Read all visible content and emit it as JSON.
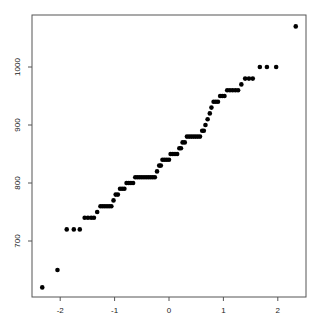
{
  "chart_data": {
    "type": "scatter",
    "title": "",
    "xlabel": "",
    "ylabel": "",
    "xlim": [
      -2.45,
      2.5
    ],
    "ylim": [
      595,
      1085
    ],
    "xticks": [
      -2,
      -1,
      0,
      1,
      2
    ],
    "yticks": [
      700,
      800,
      900,
      1000
    ],
    "grid": false,
    "legend": null,
    "point_color": "#000000",
    "points": [
      [
        -2.33,
        620
      ],
      [
        -2.05,
        650
      ],
      [
        -1.88,
        720
      ],
      [
        -1.75,
        720
      ],
      [
        -1.64,
        720
      ],
      [
        -1.55,
        740
      ],
      [
        -1.49,
        740
      ],
      [
        -1.43,
        740
      ],
      [
        -1.38,
        740
      ],
      [
        -1.32,
        750
      ],
      [
        -1.26,
        760
      ],
      [
        -1.22,
        760
      ],
      [
        -1.18,
        760
      ],
      [
        -1.14,
        760
      ],
      [
        -1.1,
        760
      ],
      [
        -1.06,
        760
      ],
      [
        -1.02,
        770
      ],
      [
        -0.98,
        780
      ],
      [
        -0.94,
        780
      ],
      [
        -0.9,
        790
      ],
      [
        -0.86,
        790
      ],
      [
        -0.82,
        790
      ],
      [
        -0.78,
        800
      ],
      [
        -0.74,
        800
      ],
      [
        -0.7,
        800
      ],
      [
        -0.66,
        800
      ],
      [
        -0.62,
        810
      ],
      [
        -0.58,
        810
      ],
      [
        -0.54,
        810
      ],
      [
        -0.5,
        810
      ],
      [
        -0.46,
        810
      ],
      [
        -0.42,
        810
      ],
      [
        -0.38,
        810
      ],
      [
        -0.34,
        810
      ],
      [
        -0.3,
        810
      ],
      [
        -0.26,
        810
      ],
      [
        -0.22,
        820
      ],
      [
        -0.18,
        830
      ],
      [
        -0.15,
        830
      ],
      [
        -0.12,
        840
      ],
      [
        -0.08,
        840
      ],
      [
        -0.04,
        840
      ],
      [
        0.0,
        840
      ],
      [
        0.03,
        850
      ],
      [
        0.07,
        850
      ],
      [
        0.11,
        850
      ],
      [
        0.15,
        850
      ],
      [
        0.19,
        860
      ],
      [
        0.22,
        860
      ],
      [
        0.25,
        870
      ],
      [
        0.29,
        870
      ],
      [
        0.33,
        880
      ],
      [
        0.37,
        880
      ],
      [
        0.41,
        880
      ],
      [
        0.45,
        880
      ],
      [
        0.49,
        880
      ],
      [
        0.53,
        880
      ],
      [
        0.57,
        880
      ],
      [
        0.61,
        890
      ],
      [
        0.64,
        890
      ],
      [
        0.67,
        900
      ],
      [
        0.71,
        910
      ],
      [
        0.75,
        920
      ],
      [
        0.78,
        930
      ],
      [
        0.82,
        940
      ],
      [
        0.86,
        940
      ],
      [
        0.9,
        940
      ],
      [
        0.94,
        950
      ],
      [
        0.98,
        950
      ],
      [
        1.02,
        950
      ],
      [
        1.07,
        960
      ],
      [
        1.12,
        960
      ],
      [
        1.17,
        960
      ],
      [
        1.22,
        960
      ],
      [
        1.27,
        960
      ],
      [
        1.33,
        970
      ],
      [
        1.4,
        980
      ],
      [
        1.47,
        980
      ],
      [
        1.54,
        980
      ],
      [
        1.67,
        1000
      ],
      [
        1.8,
        1000
      ],
      [
        1.97,
        1000
      ],
      [
        2.33,
        1070
      ]
    ]
  }
}
